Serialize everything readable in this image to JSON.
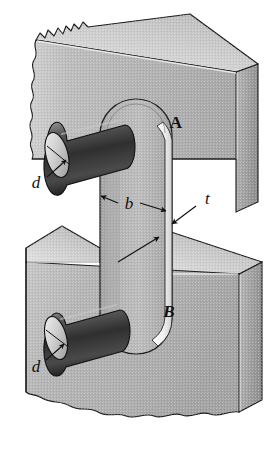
{
  "figure": {
    "type": "engineering-mechanical-diagram",
    "background_color": "#ffffff"
  },
  "labels": {
    "member_a": "A",
    "member_b": "B",
    "pin_diameter_top": "d",
    "pin_diameter_bottom": "d",
    "bar_width": "b",
    "bar_thickness": "t"
  },
  "label_styles": {
    "member_a": {
      "style": "bold-serif",
      "italic": false
    },
    "member_b": {
      "style": "bold-serif-italic",
      "italic": true
    },
    "pin_diameter_top": {
      "style": "serif-italic",
      "italic": true
    },
    "pin_diameter_bottom": {
      "style": "serif-italic",
      "italic": true
    },
    "bar_width": {
      "style": "serif-italic",
      "italic": true
    },
    "bar_thickness": {
      "style": "serif-italic",
      "italic": true
    }
  },
  "colors": {
    "outline": "#1a1a1a",
    "block_front": "#b4b4b4",
    "block_front_dark": "#9a9a9a",
    "block_top": "#d8d8d8",
    "block_side": "#a0a0a0",
    "bar_face": "#b0b0b0",
    "bar_edge_highlight": "#f2f2f2",
    "pin_dark": "#3a3a3a",
    "pin_mid": "#6e6e6e",
    "pin_light": "#d0d0d0",
    "pin_face": "#c8c8c8",
    "leader_line": "#111111",
    "page_background": "#ffffff"
  },
  "parts": [
    {
      "name": "upper-block",
      "label": "A",
      "description": "upper member shown in 3D with torn left edge"
    },
    {
      "name": "lower-block",
      "label": "B",
      "description": "lower member shown in 3D with torn bottom edge"
    },
    {
      "name": "connecting-bar",
      "label": "",
      "description": "flat bar with rounded ends spanning both members"
    },
    {
      "name": "upper-pin",
      "label": "d",
      "description": "cylindrical pin through upper bar end"
    },
    {
      "name": "lower-pin",
      "label": "d",
      "description": "cylindrical pin through lower bar end"
    }
  ],
  "dimensions": [
    {
      "symbol": "b",
      "measures": "width of flat bar",
      "arrow_style": "double-headed"
    },
    {
      "symbol": "t",
      "measures": "thickness of flat bar",
      "arrow_style": "single-leader"
    },
    {
      "symbol": "d",
      "measures": "diameter of pin",
      "arrow_style": "curved-leader"
    }
  ]
}
